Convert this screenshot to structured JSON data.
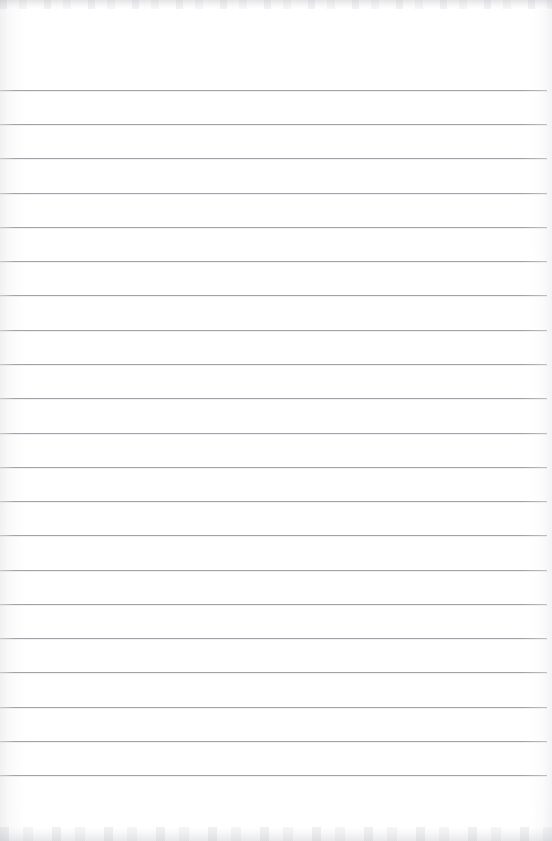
{
  "document": {
    "kind": "blank-lined-notepad-page",
    "title": "Blank lined notepad page",
    "page_width": 552,
    "page_height": 841,
    "paper_color": "#fefeff",
    "rule_color": "#9a9aa2",
    "rule_thickness_px": 1,
    "rule_count": 21,
    "first_rule_y": 90,
    "rule_spacing_px": 34.2,
    "rule_start_x": 0,
    "rule_end_x": 547,
    "has_margin_rule": false,
    "has_handwriting": false,
    "has_printed_text": false,
    "text_content": ""
  },
  "rules": [
    {
      "index": 1,
      "y": 90
    },
    {
      "index": 2,
      "y": 124
    },
    {
      "index": 3,
      "y": 158
    },
    {
      "index": 4,
      "y": 193
    },
    {
      "index": 5,
      "y": 227
    },
    {
      "index": 6,
      "y": 261
    },
    {
      "index": 7,
      "y": 295
    },
    {
      "index": 8,
      "y": 330
    },
    {
      "index": 9,
      "y": 364
    },
    {
      "index": 10,
      "y": 398
    },
    {
      "index": 11,
      "y": 433
    },
    {
      "index": 12,
      "y": 467
    },
    {
      "index": 13,
      "y": 501
    },
    {
      "index": 14,
      "y": 535
    },
    {
      "index": 15,
      "y": 570
    },
    {
      "index": 16,
      "y": 604
    },
    {
      "index": 17,
      "y": 638
    },
    {
      "index": 18,
      "y": 672
    },
    {
      "index": 19,
      "y": 707
    },
    {
      "index": 20,
      "y": 741
    },
    {
      "index": 21,
      "y": 775
    }
  ],
  "artifacts": {
    "top_band": {
      "y": 0,
      "height": 9,
      "color": "#b0b2b8"
    },
    "bottom_band": {
      "y": 828,
      "height": 14,
      "color": "#b2b4ba"
    },
    "left_vignette_width": 26,
    "right_vignette_width": 22
  }
}
